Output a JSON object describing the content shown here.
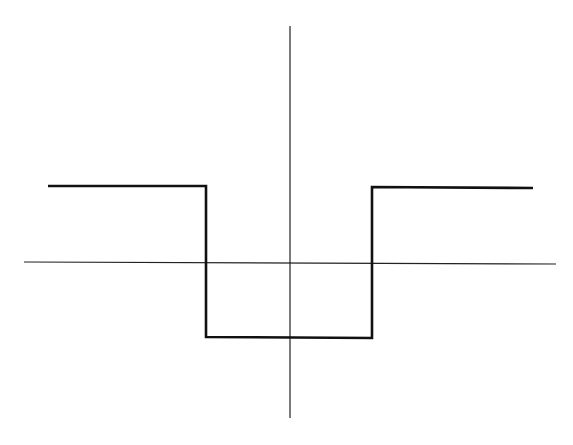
{
  "diagram": {
    "type": "step-function-plot",
    "colors": {
      "background": "#ffffff",
      "axes": "#222222",
      "curve": "#111111"
    },
    "axes": {
      "x_axis": {
        "x1": 24,
        "y1": 262,
        "x2": 556,
        "y2": 264
      },
      "y_axis": {
        "x1": 290,
        "y1": 26,
        "x2": 290,
        "y2": 418
      }
    },
    "curve_points": [
      [
        48,
        186
      ],
      [
        206,
        186
      ],
      [
        206,
        337
      ],
      [
        372,
        338
      ],
      [
        372,
        187
      ],
      [
        533,
        188
      ]
    ]
  }
}
